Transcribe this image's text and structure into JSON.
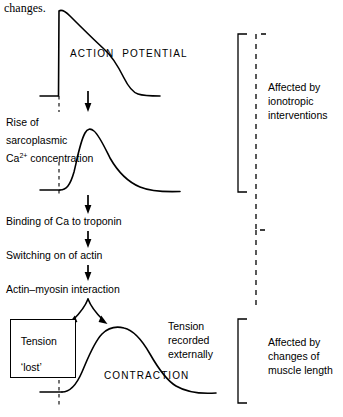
{
  "figure": {
    "type": "physiology-flow-diagram",
    "topic": "Cardiac excitation-contraction coupling",
    "bleed_text": "changes."
  },
  "traces": {
    "action_potential": {
      "label": "ACTION  POTENTIAL",
      "description": "Fast upstroke, plateau, repolarization to baseline"
    },
    "calcium_transient": {
      "label": "",
      "description": "Rapid rise to peak then slow exponential decay"
    },
    "contraction": {
      "label": "CONTRACTION",
      "description": "Slow rise to rounded peak then gradual relaxation"
    }
  },
  "steps": [
    {
      "id": "rise-ca",
      "lines": [
        "Rise of",
        "sarcoplasmic",
        "Ca2+ concentration"
      ]
    },
    {
      "id": "binding",
      "text": "Binding of Ca to troponin"
    },
    {
      "id": "switching",
      "text": "Switching on of actin"
    },
    {
      "id": "interaction",
      "text": "Actin–myosin interaction"
    }
  ],
  "step_text": {
    "rise_line1": "Rise of",
    "rise_line2": "sarcoplasmic",
    "rise_line3_pre": "Ca",
    "rise_line3_sup": "2+",
    "rise_line3_post": " concentration",
    "binding": "Binding of Ca to troponin",
    "switching": "Switching on of actin",
    "interaction": "Actin–myosin interaction"
  },
  "tension_box": {
    "line1": "Tension",
    "line2": "‘lost’"
  },
  "tension_recorded": {
    "line1": "Tension",
    "line2": "recorded",
    "line3": "externally"
  },
  "brackets": [
    {
      "id": "ionotropic",
      "style": "solid",
      "lines": [
        "Affected by",
        "ionotropic",
        "interventions"
      ]
    },
    {
      "id": "muscle-length",
      "style": "solid",
      "lines": [
        "Affected by",
        "changes of",
        "muscle length"
      ]
    }
  ],
  "bracket_labels": {
    "ionotropic_l1": "Affected by",
    "ionotropic_l2": "ionotropic",
    "ionotropic_l3": "interventions",
    "length_l1": "Affected by",
    "length_l2": "changes of",
    "length_l3": "muscle length"
  },
  "curve_labels": {
    "action_potential": "ACTION  POTENTIAL",
    "contraction": "CONTRACTION"
  },
  "colors": {
    "ink": "#000000",
    "background": "#ffffff"
  }
}
